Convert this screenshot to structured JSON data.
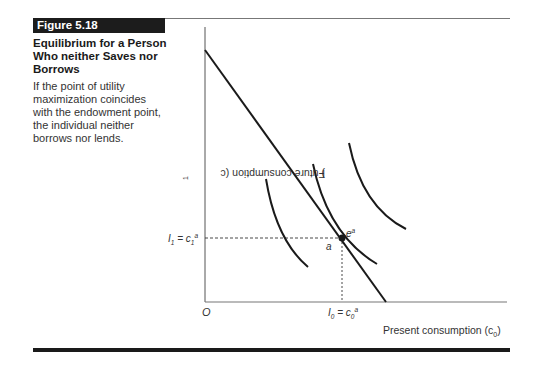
{
  "figure": {
    "label": "Figure 5.18",
    "title": "Equilibrium for a Person Who neither Saves nor Borrows",
    "caption": "If the point of utility maximization coincides with the endowment point, the individual neither borrows nor lends."
  },
  "axes": {
    "y_label": "Future consumption (c",
    "y_label_sub": "1",
    "y_label_end": ")",
    "x_label": "Present consumption (c",
    "x_label_sub": "0",
    "x_label_end": ")",
    "origin": "O"
  },
  "points": {
    "endowment_label": "a",
    "optimum_label": "e",
    "optimum_sup": "a",
    "x_marker": {
      "lhs": "I",
      "lhs_sub": "0",
      "eq": " = c",
      "rhs_sub": "0",
      "rhs_sup": "a"
    },
    "y_marker": {
      "lhs": "I",
      "lhs_sub": "1",
      "eq": " = c",
      "rhs_sub": "1",
      "rhs_sup": "a"
    }
  },
  "colors": {
    "ink": "#1a1a1a",
    "label_bg": "#1c1c1c",
    "rule": "#777777"
  }
}
